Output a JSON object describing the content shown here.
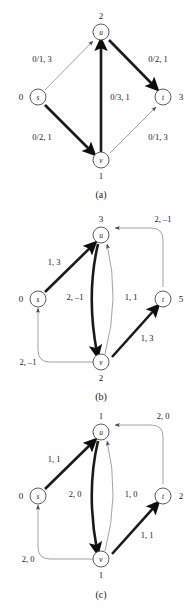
{
  "figure": {
    "panels": [
      {
        "id": "a",
        "caption": "(a)",
        "nodes": [
          {
            "id": "s",
            "letter": "s",
            "value": "0"
          },
          {
            "id": "u",
            "letter": "u",
            "value": "2"
          },
          {
            "id": "v",
            "letter": "v",
            "value": "1"
          },
          {
            "id": "t",
            "letter": "t",
            "value": "3"
          }
        ],
        "edges": [
          {
            "from": "s",
            "to": "u",
            "label": "0/1, 3",
            "weight": "thin"
          },
          {
            "from": "u",
            "to": "t",
            "label": "0/2, 1",
            "weight": "thick"
          },
          {
            "from": "s",
            "to": "v",
            "label": "0/2, 1",
            "weight": "thick"
          },
          {
            "from": "v",
            "to": "t",
            "label": "0/1, 3",
            "weight": "thin"
          },
          {
            "from": "v",
            "to": "u",
            "label": "0/3, 1",
            "weight": "thick"
          }
        ]
      },
      {
        "id": "b",
        "caption": "(b)",
        "nodes": [
          {
            "id": "s",
            "letter": "s",
            "value": "0"
          },
          {
            "id": "u",
            "letter": "u",
            "value": "3"
          },
          {
            "id": "v",
            "letter": "v",
            "value": "2"
          },
          {
            "id": "t",
            "letter": "t",
            "value": "5"
          }
        ],
        "edges": [
          {
            "from": "s",
            "to": "u",
            "label": "1, 3",
            "weight": "thick"
          },
          {
            "from": "t",
            "to": "u",
            "label": "2, –1",
            "weight": "thin"
          },
          {
            "from": "u",
            "to": "v",
            "label": "2, –1",
            "weight": "thick"
          },
          {
            "from": "v",
            "to": "u",
            "label": "1, 1",
            "weight": "thin"
          },
          {
            "from": "v",
            "to": "t",
            "label": "1, 3",
            "weight": "thick"
          },
          {
            "from": "v",
            "to": "s",
            "label": "2, –1",
            "weight": "thin"
          }
        ]
      },
      {
        "id": "c",
        "caption": "(c)",
        "nodes": [
          {
            "id": "s",
            "letter": "s",
            "value": "0"
          },
          {
            "id": "u",
            "letter": "u",
            "value": "1"
          },
          {
            "id": "v",
            "letter": "v",
            "value": "1"
          },
          {
            "id": "t",
            "letter": "t",
            "value": "2"
          }
        ],
        "edges": [
          {
            "from": "s",
            "to": "u",
            "label": "1, 1",
            "weight": "thick"
          },
          {
            "from": "t",
            "to": "u",
            "label": "2, 0",
            "weight": "thin"
          },
          {
            "from": "u",
            "to": "v",
            "label": "2, 0",
            "weight": "thick"
          },
          {
            "from": "v",
            "to": "u",
            "label": "1, 0",
            "weight": "thin"
          },
          {
            "from": "v",
            "to": "t",
            "label": "1, 1",
            "weight": "thick"
          },
          {
            "from": "v",
            "to": "s",
            "label": "2, 0",
            "weight": "thin"
          }
        ]
      }
    ],
    "colors": {
      "thin_edge": "#8c8c8c",
      "thick_edge": "#1a1a1a",
      "node_stroke": "#4a4a4a",
      "text": "#1a1a1a",
      "background": "#ffffff"
    }
  }
}
